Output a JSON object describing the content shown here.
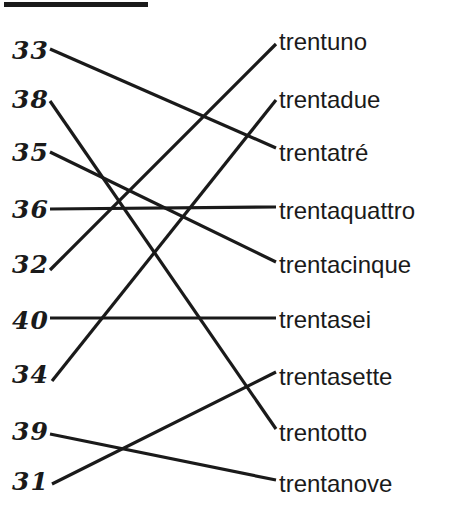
{
  "page": {
    "background_color": "#ffffff",
    "ink_color": "#1a1a1a",
    "width": 454,
    "height": 517
  },
  "top_rule": {
    "name": "heading-underline",
    "x": 4,
    "y": 2,
    "width": 144,
    "height": 5,
    "color": "#1a1a1a"
  },
  "left_column": {
    "label": "numerals",
    "items": [
      {
        "id": "n33",
        "text": "33",
        "x": 12,
        "y": 38
      },
      {
        "id": "n38",
        "text": "38",
        "x": 12,
        "y": 87
      },
      {
        "id": "n35",
        "text": "35",
        "x": 12,
        "y": 140
      },
      {
        "id": "n36",
        "text": "36",
        "x": 12,
        "y": 197
      },
      {
        "id": "n32",
        "text": "32",
        "x": 12,
        "y": 252
      },
      {
        "id": "n40",
        "text": "40",
        "x": 12,
        "y": 308
      },
      {
        "id": "n34",
        "text": "34",
        "x": 12,
        "y": 362
      },
      {
        "id": "n39",
        "text": "39",
        "x": 12,
        "y": 419
      },
      {
        "id": "n31",
        "text": "31",
        "x": 12,
        "y": 469
      }
    ]
  },
  "right_column": {
    "label": "number words",
    "items": [
      {
        "id": "w31",
        "text": "trentuno",
        "x": 279,
        "y": 30
      },
      {
        "id": "w32",
        "text": "trentadue",
        "x": 279,
        "y": 88
      },
      {
        "id": "w33",
        "text": "trentatré",
        "x": 279,
        "y": 141
      },
      {
        "id": "w34",
        "text": "trentaquattro",
        "x": 279,
        "y": 199
      },
      {
        "id": "w35",
        "text": "trentacinque",
        "x": 279,
        "y": 253
      },
      {
        "id": "w36",
        "text": "trentasei",
        "x": 279,
        "y": 308
      },
      {
        "id": "w37",
        "text": "trentasette",
        "x": 279,
        "y": 365
      },
      {
        "id": "w38",
        "text": "trentotto",
        "x": 279,
        "y": 421
      },
      {
        "id": "w39",
        "text": "trentanove",
        "x": 279,
        "y": 472
      }
    ]
  },
  "connections": [
    {
      "id": "c1",
      "from": "33",
      "to": "trentatré",
      "x1": 50,
      "y1": 49,
      "x2": 276,
      "y2": 148
    },
    {
      "id": "c2",
      "from": "38",
      "to": "trentotto",
      "x1": 50,
      "y1": 101,
      "x2": 276,
      "y2": 429
    },
    {
      "id": "c3",
      "from": "35",
      "to": "trentacinque",
      "x1": 50,
      "y1": 152,
      "x2": 276,
      "y2": 262
    },
    {
      "id": "c4",
      "from": "36",
      "to": "trentaquattro",
      "x1": 50,
      "y1": 209,
      "x2": 276,
      "y2": 207
    },
    {
      "id": "c5",
      "from": "32",
      "to": "trentuno",
      "x1": 50,
      "y1": 270,
      "x2": 276,
      "y2": 44
    },
    {
      "id": "c6",
      "from": "40",
      "to": "trentasei",
      "x1": 50,
      "y1": 318,
      "x2": 276,
      "y2": 318
    },
    {
      "id": "c7",
      "from": "34",
      "to": "trentadue",
      "x1": 52,
      "y1": 381,
      "x2": 276,
      "y2": 100
    },
    {
      "id": "c8",
      "from": "39",
      "to": "trentanove",
      "x1": 50,
      "y1": 434,
      "x2": 276,
      "y2": 480
    },
    {
      "id": "c9",
      "from": "31",
      "to": "trentasette",
      "x1": 52,
      "y1": 484,
      "x2": 276,
      "y2": 372
    }
  ],
  "line_style": {
    "color": "#1a1a1a",
    "width": 3.2
  }
}
